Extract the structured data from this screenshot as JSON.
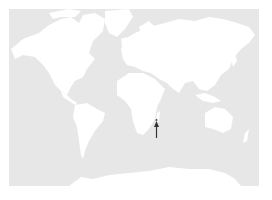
{
  "map": {
    "projection": "world-mercator",
    "colors": {
      "ocean": "#e7e7e7",
      "land": "#ffffff",
      "marker": "#333333"
    },
    "marker": {
      "type": "arrow-up",
      "label": "",
      "location_hint": "east of Madagascar (Indian Ocean island)"
    }
  }
}
